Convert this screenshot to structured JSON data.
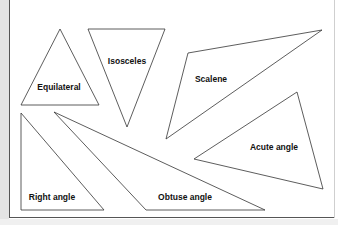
{
  "diagram": {
    "stroke_color": "#333333",
    "triangles": [
      {
        "name": "equilateral",
        "label": "Equilateral",
        "points": "60,29 21,105 99,105",
        "label_x": 59,
        "label_y": 90
      },
      {
        "name": "isosceles",
        "label": "Isosceles",
        "points": "88,29 165,29 127,127",
        "label_x": 127,
        "label_y": 64
      },
      {
        "name": "scalene",
        "label": "Scalene",
        "points": "188,53 322,30 166,139",
        "label_x": 211,
        "label_y": 82
      },
      {
        "name": "acute-angle",
        "label": "Acute angle",
        "points": "297,92 194,159 323,189",
        "label_x": 274,
        "label_y": 150
      },
      {
        "name": "right-angle",
        "label": "Right angle",
        "points": "21,113 21,210 104,210",
        "label_x": 52,
        "label_y": 200
      },
      {
        "name": "obtuse-angle",
        "label": "Obtuse angle",
        "points": "54,112 146,210 265,210",
        "label_x": 185,
        "label_y": 200
      }
    ]
  }
}
